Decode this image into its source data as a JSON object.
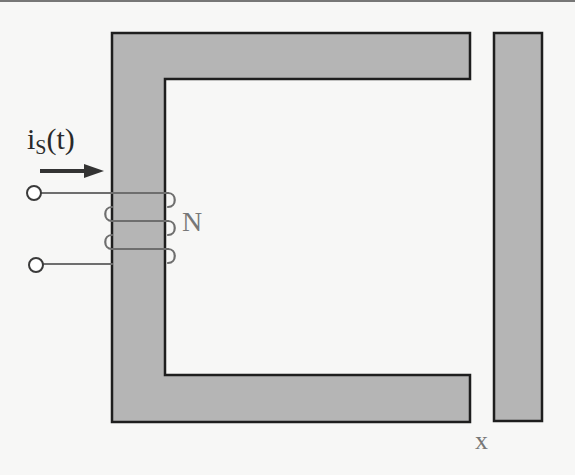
{
  "diagram": {
    "type": "magnetic circuit (C-core electromagnet with movable armature)",
    "colors": {
      "background": "#f7f7f6",
      "core_fill": "#b5b5b5",
      "core_outline": "#1e1e1e",
      "winding": "#6e6e6e",
      "terminal": "#3a3a3a",
      "arrow": "#333333",
      "label_gray": "#777777"
    },
    "labels": {
      "current_symbol": "i",
      "current_subscript": "S",
      "current_argument": "(t)",
      "turns": "N",
      "gap": "x"
    },
    "components": [
      {
        "name": "c-core",
        "description": "C-shaped stator core, opening to the right"
      },
      {
        "name": "armature",
        "description": "Vertical bar to the right of the core, separated by air gap x"
      },
      {
        "name": "winding",
        "description": "Coil of N turns wound on left leg of core, fed by two terminals"
      },
      {
        "name": "current-arrow",
        "description": "Arrow indicating direction of source current i_S(t) into coil"
      }
    ]
  }
}
